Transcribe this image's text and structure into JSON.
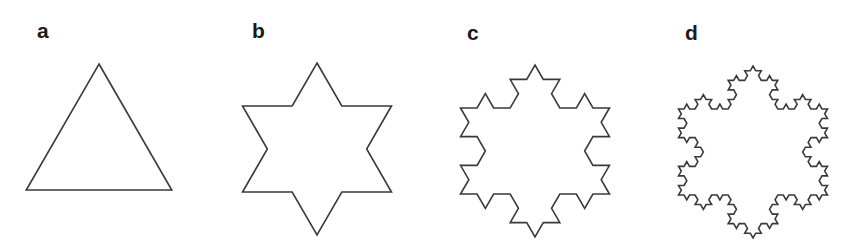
{
  "figure": {
    "stroke_color": "#3a3a3a",
    "panels": [
      {
        "label": "a",
        "iteration": 0,
        "label_pos": [
          37,
          20
        ],
        "center": [
          99,
          148
        ],
        "radius": 84
      },
      {
        "label": "b",
        "iteration": 1,
        "label_pos": [
          252,
          20
        ],
        "center": [
          317,
          149
        ],
        "radius": 86
      },
      {
        "label": "c",
        "iteration": 2,
        "label_pos": [
          467,
          22
        ],
        "center": [
          535,
          151
        ],
        "radius": 86
      },
      {
        "label": "d",
        "iteration": 3,
        "label_pos": [
          685,
          22
        ],
        "center": [
          753,
          152
        ],
        "radius": 86
      }
    ]
  }
}
